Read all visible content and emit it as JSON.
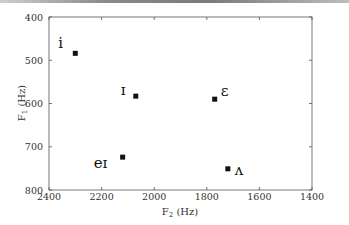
{
  "chart_data": {
    "type": "scatter",
    "title": "",
    "xlabel": "F2 (Hz)",
    "ylabel": "F1 (Hz)",
    "xlim": [
      2400,
      1400
    ],
    "ylim": [
      800,
      400
    ],
    "x_reversed": true,
    "y_reversed": true,
    "xticks": [
      2400,
      2200,
      2000,
      1800,
      1600,
      1400
    ],
    "yticks": [
      400,
      500,
      600,
      700,
      800
    ],
    "grid": false,
    "legend": null,
    "points": [
      {
        "label": "i",
        "F2": 2300,
        "F1": 484
      },
      {
        "label": "ɪ",
        "F2": 2070,
        "F1": 583
      },
      {
        "label": "ɛ",
        "F2": 1770,
        "F1": 590
      },
      {
        "label": "eɪ",
        "F2": 2120,
        "F1": 724
      },
      {
        "label": "ʌ",
        "F2": 1720,
        "F1": 751
      }
    ]
  },
  "axes": {
    "x_label_main": "F",
    "x_label_sub": "2",
    "x_label_unit": " (Hz)",
    "y_label_main": "F",
    "y_label_sub": "1",
    "y_label_unit": " (Hz)"
  },
  "colors": {
    "marker": "#111111",
    "axis": "#555555"
  }
}
